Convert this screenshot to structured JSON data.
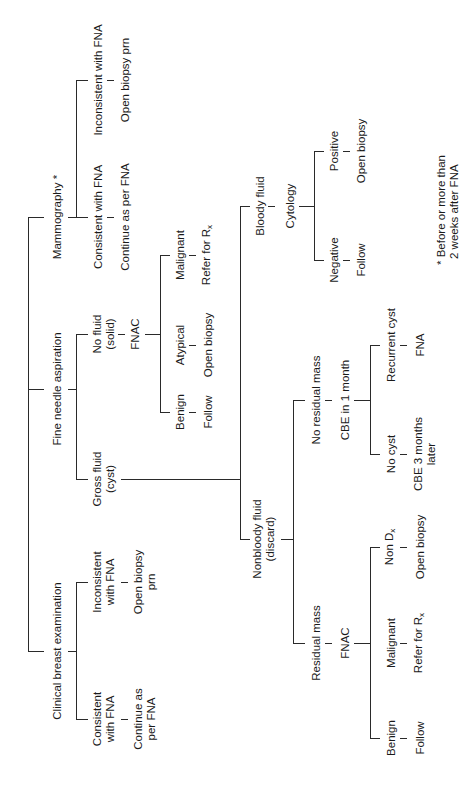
{
  "diagram": {
    "footnote": {
      "line1": "* Before or more than",
      "line2": "2 weeks after FNA"
    },
    "nodes": {
      "mammography": "Mammography *",
      "fna": "Fine needle aspiration",
      "cbe": "Clinical breast examination",
      "mammo_consistent": "Consistent with FNA",
      "mammo_continue": "Continue as per FNA",
      "mammo_inconsistent": "Inconsistent with FNA",
      "mammo_open_biopsy": "Open biopsy prn",
      "no_fluid_1": "No fluid",
      "no_fluid_2": "(solid)",
      "fnac_solid": "FNAC",
      "solid_benign": "Benign",
      "solid_follow": "Follow",
      "solid_atypical": "Atypical",
      "solid_open_biopsy": "Open biopsy",
      "solid_malignant": "Malignant",
      "solid_refer": "Refer for R",
      "solid_refer_sub": "x",
      "gross_fluid_1": "Gross fluid",
      "gross_fluid_2": "(cyst)",
      "bloody_fluid": "Bloody fluid",
      "cytology": "Cytology",
      "cyto_negative": "Negative",
      "cyto_follow": "Follow",
      "cyto_positive": "Positive",
      "cyto_open_biopsy": "Open biopsy",
      "nonbloody_1": "Nonbloody fluid",
      "nonbloody_2": "(discard)",
      "no_residual": "No residual mass",
      "cbe_1month": "CBE in 1 month",
      "no_cyst": "No cyst",
      "cbe_3months_1": "CBE 3 months",
      "cbe_3months_2": "later",
      "recurrent_cyst": "Recurrent cyst",
      "recurrent_fna": "FNA",
      "residual_mass": "Residual mass",
      "fnac_residual": "FNAC",
      "res_benign": "Benign",
      "res_follow": "Follow",
      "res_malignant": "Malignant",
      "res_refer": "Refer for R",
      "res_refer_sub": "x",
      "res_non_dx": "Non D",
      "res_non_dx_sub": "x",
      "res_open_biopsy": "Open biopsy",
      "cbe_consistent_1": "Consistent",
      "cbe_consistent_2": "with FNA",
      "cbe_continue_1": "Continue as",
      "cbe_continue_2": "per FNA",
      "cbe_inconsistent_1": "Inconsistent",
      "cbe_inconsistent_2": "with FNA",
      "cbe_open_biopsy_1": "Open biopsy",
      "cbe_open_biopsy_2": "prn"
    }
  }
}
